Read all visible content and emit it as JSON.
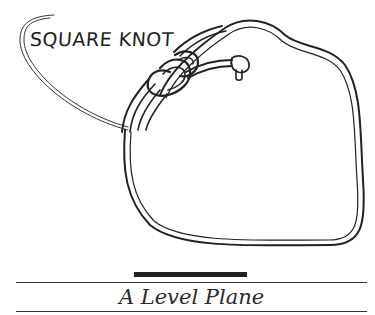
{
  "illustration": {
    "label": "SQUARE KNOT",
    "subject": "square-knot-rope-drawing"
  },
  "caption": {
    "title": "A Level Plane"
  },
  "colors": {
    "ink": "#222222",
    "background": "#ffffff"
  }
}
